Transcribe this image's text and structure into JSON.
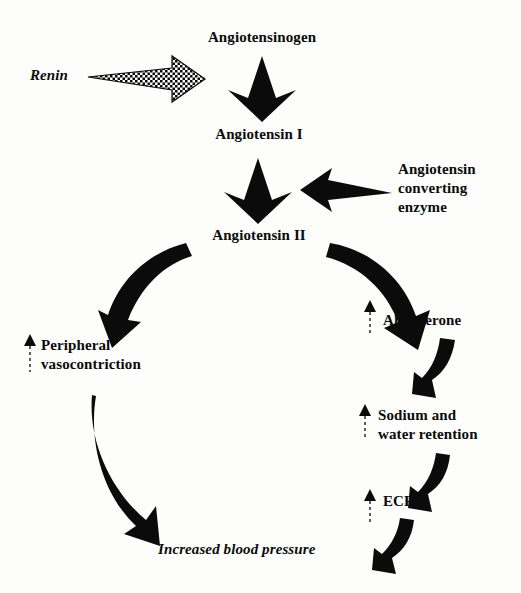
{
  "diagram": {
    "ink_color": "#0b0b0b",
    "background_color": "#fdfdfb",
    "nodes": {
      "angiotensinogen": "Angiotensinogen",
      "renin": "Renin",
      "angiotensin_1": "Angiotensin I",
      "ace": "Angiotensin\nconverting\nenzyme",
      "angiotensin_2": "Angiotensin II",
      "peripheral_vasoconstriction": "Peripheral\nvasocontriction",
      "aldosterone": "Aldosterone",
      "sodium_water_retention": "Sodium and\nwater retention",
      "ecf": "ECF",
      "increased_blood_pressure": "Increased blood pressure"
    },
    "edges": [
      {
        "from": "renin",
        "to": "angiotensinogen",
        "style": "hatched-block-arrow",
        "direction": "right"
      },
      {
        "from": "angiotensinogen",
        "to": "angiotensin_1",
        "style": "solid-block-arrow",
        "direction": "down"
      },
      {
        "from": "angiotensin_1",
        "to": "angiotensin_2",
        "style": "solid-block-arrow",
        "direction": "down"
      },
      {
        "from": "ace",
        "to": "angiotensin_1_to_2",
        "style": "tapered-arrow",
        "direction": "left"
      },
      {
        "from": "angiotensin_2",
        "to": "peripheral_vasoconstriction",
        "style": "curved-arrow",
        "direction": "down-left"
      },
      {
        "from": "angiotensin_2",
        "to": "aldosterone",
        "style": "curved-arrow",
        "direction": "down-right"
      },
      {
        "from": "peripheral_vasoconstriction",
        "to": "increased_blood_pressure",
        "style": "curved-arrow",
        "direction": "down-right"
      },
      {
        "from": "aldosterone",
        "to": "sodium_water_retention",
        "style": "hook-arrow",
        "direction": "down"
      },
      {
        "from": "sodium_water_retention",
        "to": "ecf",
        "style": "hook-arrow",
        "direction": "down"
      },
      {
        "from": "ecf",
        "to": "increased_blood_pressure",
        "style": "hook-arrow",
        "direction": "down-left"
      }
    ],
    "increase_markers": [
      {
        "for": "peripheral_vasoconstriction",
        "symbol": "up-arrow"
      },
      {
        "for": "aldosterone",
        "symbol": "up-arrow"
      },
      {
        "for": "sodium_water_retention",
        "symbol": "up-arrow"
      },
      {
        "for": "ecf",
        "symbol": "up-arrow"
      }
    ]
  }
}
